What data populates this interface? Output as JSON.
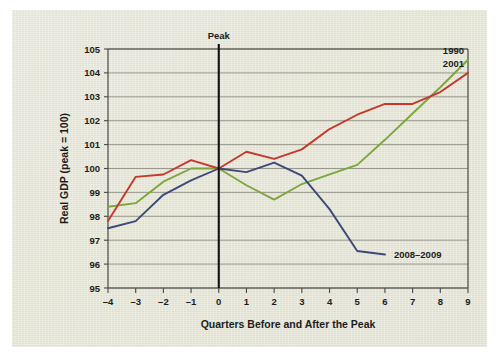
{
  "chart_data": {
    "type": "line",
    "title": "",
    "xlabel": "Quarters Before and After the Peak",
    "ylabel": "Real GDP (peak = 100)",
    "xlim": [
      -4,
      9
    ],
    "ylim": [
      95,
      105
    ],
    "yticks": [
      95,
      96,
      97,
      98,
      99,
      100,
      101,
      102,
      103,
      104,
      105
    ],
    "xticks": [
      -4,
      -3,
      -2,
      -1,
      0,
      1,
      2,
      3,
      4,
      5,
      6,
      7,
      8,
      9
    ],
    "xtick_labels": [
      "–4",
      "–3",
      "–2",
      "–1",
      "0",
      "1",
      "2",
      "3",
      "4",
      "5",
      "6",
      "7",
      "8",
      "9"
    ],
    "ytick_labels": [
      "95",
      "96",
      "97",
      "98",
      "99",
      "100",
      "101",
      "102",
      "103",
      "104",
      "105"
    ],
    "grid": true,
    "grid_axis": "y",
    "legend_position": "inline-right",
    "annotations": [
      {
        "text": "Peak",
        "x": 0,
        "y": 105,
        "type": "vertical-rule-label"
      }
    ],
    "series": [
      {
        "name": "1990",
        "color": "#7da63c",
        "label_x": 9,
        "label_y": 104.55,
        "x": [
          -4,
          -3,
          -2,
          -1,
          0,
          1,
          2,
          3,
          4,
          5,
          6,
          7,
          8,
          9
        ],
        "values": [
          98.4,
          98.55,
          99.45,
          100.0,
          100.0,
          99.3,
          98.7,
          99.35,
          99.75,
          100.15,
          101.2,
          102.3,
          103.4,
          104.55
        ]
      },
      {
        "name": "2001",
        "color": "#c4392c",
        "label_x": 9,
        "label_y": 104.0,
        "x": [
          -4,
          -3,
          -2,
          -1,
          0,
          1,
          2,
          3,
          4,
          5,
          6,
          7,
          8,
          9
        ],
        "values": [
          97.8,
          99.65,
          99.75,
          100.35,
          100.0,
          100.7,
          100.4,
          100.8,
          101.65,
          102.25,
          102.7,
          102.7,
          103.2,
          104.0
        ]
      },
      {
        "name": "2008–2009",
        "color": "#3d4a78",
        "label_x": 6,
        "label_y": 96.4,
        "x": [
          -4,
          -3,
          -2,
          -1,
          0,
          1,
          2,
          3,
          4,
          5,
          6
        ],
        "values": [
          97.5,
          97.8,
          98.9,
          99.5,
          100.0,
          99.85,
          100.25,
          99.7,
          98.3,
          96.55,
          96.4
        ]
      }
    ]
  },
  "colors": {
    "panel_background": "#e7e7d8",
    "grid": "#8f8f84",
    "axis": "#4a4a44",
    "peak_rule": "#111111",
    "text": "#1d1d1b",
    "series_1990": "#7da63c",
    "series_2001": "#c4392c",
    "series_2008_2009": "#3d4a78"
  }
}
